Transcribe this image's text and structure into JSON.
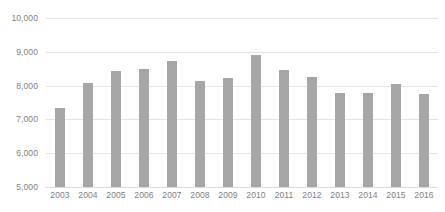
{
  "chart_data": {
    "type": "bar",
    "title": "",
    "subtitle": "",
    "xlabel": "",
    "ylabel": "",
    "categories": [
      "2003",
      "2004",
      "2005",
      "2006",
      "2007",
      "2008",
      "2009",
      "2010",
      "2011",
      "2012",
      "2013",
      "2014",
      "2015",
      "2016"
    ],
    "values": [
      7350,
      8080,
      8430,
      8480,
      8740,
      8130,
      8230,
      8920,
      8470,
      8260,
      7780,
      7780,
      8040,
      7760
    ],
    "series": [
      {
        "name": "",
        "values": [
          7350,
          8080,
          8430,
          8480,
          8740,
          8130,
          8230,
          8920,
          8470,
          8260,
          7780,
          7780,
          8040,
          7760
        ]
      }
    ],
    "ylim": [
      5000,
      10000
    ],
    "ytick_step": 1000,
    "ytick_labels": [
      "10,000",
      "9,000",
      "8,000",
      "7,000",
      "6,000",
      "5,000"
    ],
    "ytick_values": [
      10000,
      9000,
      8000,
      7000,
      6000,
      5000
    ],
    "grid": true,
    "legend": false,
    "legend_position": "none",
    "bar_color": "#a6a6a6",
    "gridline_color": "#e4e4e4",
    "axis_text_color": "#808080",
    "background_color": "#ffffff"
  }
}
